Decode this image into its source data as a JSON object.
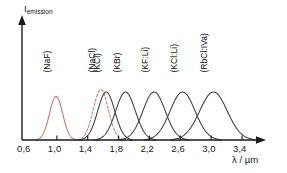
{
  "axes": {
    "y_label_main": "I",
    "y_label_sub": "emission",
    "x_label": "λ / µm",
    "x_ticks": [
      "0,6",
      "1,0",
      "1,4",
      "1,8",
      "2,2",
      "2,6",
      "3,0",
      "3,4"
    ]
  },
  "chart_data": {
    "type": "line",
    "title": "",
    "xlabel": "λ / µm",
    "ylabel": "I emission",
    "xlim": [
      0.6,
      3.5
    ],
    "ylim": [
      0,
      1.15
    ],
    "grid": false,
    "legend": "inline-rotated-labels",
    "x_ticks": [
      0.6,
      1.0,
      1.4,
      1.8,
      2.2,
      2.6,
      3.0,
      3.4
    ],
    "x_tick_labels": [
      "0,6",
      "1,0",
      "1,4",
      "1,8",
      "2,2",
      "2,6",
      "3,0",
      "3,4"
    ],
    "series": [
      {
        "name": "F2+ (NaF)",
        "center_label_top": "(NaF)",
        "center_label_bottom_main": "F",
        "center_label_sub": "2",
        "center_label_sup": "+",
        "prefix": "",
        "peak_um": 0.99,
        "fwhm_um": 0.2,
        "peak_intensity": 0.91,
        "color": "#c4756b",
        "dashed": false
      },
      {
        "name": "F2+ (NaCl)",
        "center_label_top": "(NaCl)",
        "center_label_bottom_main": "F",
        "center_label_sub": "2",
        "center_label_sup": "+",
        "prefix": "",
        "peak_um": 1.57,
        "fwhm_um": 0.23,
        "peak_intensity": 1.05,
        "color": "#cf7a70",
        "dashed": true
      },
      {
        "name": "F2+ (KCl)",
        "center_label_top": "(KCl)",
        "center_label_bottom_main": "F",
        "center_label_sub": "2",
        "center_label_sup": "+",
        "prefix": "",
        "peak_um": 1.64,
        "fwhm_um": 0.26,
        "peak_intensity": 1.0,
        "color": "#3c3c46",
        "dashed": false
      },
      {
        "name": "F2+ (KBr)",
        "center_label_top": "(KBr)",
        "center_label_bottom_main": "F",
        "center_label_sub": "2",
        "center_label_sup": "+",
        "prefix": "",
        "peak_um": 1.89,
        "fwhm_um": 0.3,
        "peak_intensity": 1.0,
        "color": "#3c3c46",
        "dashed": false
      },
      {
        "name": "FA II (KF:Li)",
        "center_label_top": "(KF:Li)",
        "center_label_bottom_main": "F",
        "center_label_sub": "A",
        "center_label_sup": "",
        "prefix": "II",
        "peak_um": 2.26,
        "fwhm_um": 0.34,
        "peak_intensity": 1.0,
        "color": "#3c3c46",
        "dashed": false
      },
      {
        "name": "FA II (KCl:Li)",
        "center_label_top": "(KCl:Li)",
        "center_label_bottom_main": "F",
        "center_label_sub": "A",
        "center_label_sup": "",
        "prefix": "II",
        "peak_um": 2.63,
        "fwhm_um": 0.38,
        "peak_intensity": 1.0,
        "color": "#3c3c46",
        "dashed": false
      },
      {
        "name": "FA II (RbCl:IVa)",
        "center_label_top": "(RbCl:IVa)",
        "center_label_bottom_main": "F",
        "center_label_sub": "A",
        "center_label_sup": "",
        "prefix": "II",
        "peak_um": 3.03,
        "fwhm_um": 0.42,
        "peak_intensity": 1.0,
        "color": "#3c3c46",
        "dashed": false
      }
    ]
  }
}
